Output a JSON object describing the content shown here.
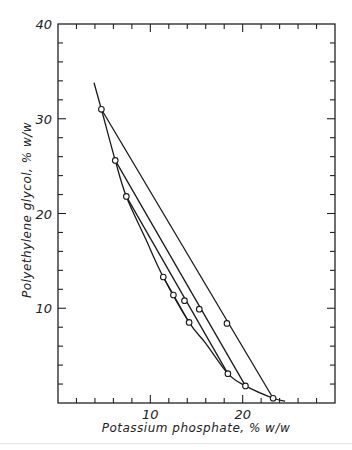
{
  "chart_data": {
    "type": "line",
    "title": "",
    "xlabel": "Potassium phosphate, % w/w",
    "ylabel": "Polyethylene glycol, % w/w",
    "xlim": [
      0,
      30
    ],
    "ylim": [
      0,
      40
    ],
    "x_ticks_major": [
      10,
      20
    ],
    "x_tick_labels": [
      "10",
      "20"
    ],
    "x_minor_step": 2,
    "y_ticks_major": [
      10,
      20,
      30,
      40
    ],
    "y_tick_labels": [
      "10",
      "20",
      "30",
      "40"
    ],
    "y_minor_step": 2,
    "grid": false,
    "legend": null,
    "series": [
      {
        "name": "binodal",
        "style": "curve",
        "points": [
          [
            3.9,
            33.8
          ],
          [
            4.7,
            31.0
          ],
          [
            6.2,
            25.6
          ],
          [
            7.4,
            21.8
          ],
          [
            9.5,
            17.3
          ],
          [
            11.4,
            13.3
          ],
          [
            14.2,
            8.5
          ],
          [
            16.0,
            6.3
          ],
          [
            18.4,
            3.1
          ],
          [
            20.3,
            1.8
          ],
          [
            23.3,
            0.5
          ],
          [
            24.6,
            0.2
          ]
        ]
      },
      {
        "name": "tie-line-1",
        "style": "tie",
        "points": [
          [
            4.7,
            31.0
          ],
          [
            18.3,
            8.4
          ],
          [
            23.3,
            0.5
          ]
        ]
      },
      {
        "name": "tie-line-2",
        "style": "tie",
        "points": [
          [
            6.2,
            25.6
          ],
          [
            15.3,
            9.9
          ],
          [
            20.3,
            1.8
          ]
        ]
      },
      {
        "name": "tie-line-3",
        "style": "tie",
        "points": [
          [
            7.4,
            21.8
          ],
          [
            13.7,
            10.8
          ],
          [
            18.4,
            3.1
          ]
        ]
      },
      {
        "name": "tie-line-4",
        "style": "tie",
        "points": [
          [
            11.4,
            13.3
          ],
          [
            12.5,
            11.4
          ],
          [
            14.2,
            8.5
          ]
        ]
      }
    ],
    "markers": [
      [
        4.7,
        31.0
      ],
      [
        6.2,
        25.6
      ],
      [
        7.4,
        21.8
      ],
      [
        11.4,
        13.3
      ],
      [
        12.5,
        11.4
      ],
      [
        13.7,
        10.8
      ],
      [
        15.3,
        9.9
      ],
      [
        14.2,
        8.5
      ],
      [
        18.3,
        8.4
      ],
      [
        18.4,
        3.1
      ],
      [
        20.3,
        1.8
      ],
      [
        23.3,
        0.5
      ]
    ]
  }
}
